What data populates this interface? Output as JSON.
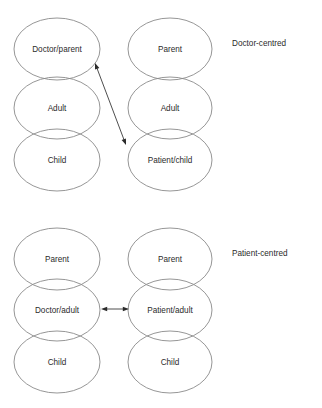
{
  "diagram": {
    "type": "transactional-analysis-ego-state-diagram",
    "groups": [
      {
        "id": "doctor-centred",
        "label": "Doctor-centred",
        "label_x": 232,
        "label_y": 44,
        "columns": [
          {
            "id": "left",
            "cx": 57,
            "rx": 43,
            "ry": 31,
            "ellipses": [
              {
                "id": "doctor-parent",
                "label": "Doctor/parent",
                "cy": 49
              },
              {
                "id": "adult",
                "label": "Adult",
                "cy": 108
              },
              {
                "id": "child",
                "label": "Child",
                "cy": 160
              }
            ]
          },
          {
            "id": "right",
            "cx": 170,
            "rx": 42,
            "ry": 31,
            "ellipses": [
              {
                "id": "parent",
                "label": "Parent",
                "cy": 49
              },
              {
                "id": "adult",
                "label": "Adult",
                "cy": 108
              },
              {
                "id": "patient-child",
                "label": "Patient/child",
                "cy": 160
              }
            ]
          }
        ],
        "arrows": [
          {
            "id": "doctor-parent-to-patient-child",
            "x1": 95,
            "y1": 63,
            "x2": 126,
            "y2": 145,
            "double_headed": true,
            "orientation": "diagonal"
          }
        ]
      },
      {
        "id": "patient-centred",
        "label": "Patient-centred",
        "label_x": 232,
        "label_y": 254,
        "columns": [
          {
            "id": "left",
            "cx": 57,
            "rx": 43,
            "ry": 31,
            "ellipses": [
              {
                "id": "parent",
                "label": "Parent",
                "cy": 259
              },
              {
                "id": "doctor-adult",
                "label": "Doctor/adult",
                "cy": 310
              },
              {
                "id": "child",
                "label": "Child",
                "cy": 362
              }
            ]
          },
          {
            "id": "right",
            "cx": 170,
            "rx": 42,
            "ry": 31,
            "ellipses": [
              {
                "id": "parent",
                "label": "Parent",
                "cy": 259
              },
              {
                "id": "patient-adult",
                "label": "Patient/adult",
                "cy": 310
              },
              {
                "id": "child",
                "label": "Child",
                "cy": 362
              }
            ]
          }
        ],
        "arrows": [
          {
            "id": "doctor-adult-to-patient-adult",
            "x1": 101,
            "y1": 309,
            "x2": 129,
            "y2": 309,
            "double_headed": true,
            "orientation": "horizontal"
          }
        ]
      }
    ],
    "colors": {
      "background": "#ffffff",
      "ellipse_stroke": "#8a8a8a",
      "text": "#2b2b2b",
      "arrow": "#3a3a3a"
    }
  }
}
